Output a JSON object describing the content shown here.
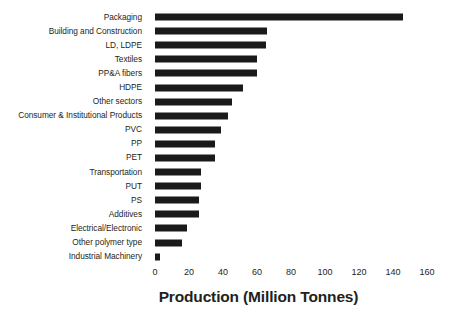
{
  "chart_data": {
    "type": "bar",
    "orientation": "horizontal",
    "title": "",
    "xlabel": "Production (Million Tonnes)",
    "ylabel": "",
    "xlim": [
      0,
      160
    ],
    "xticks": [
      0,
      20,
      40,
      60,
      80,
      100,
      120,
      140,
      160
    ],
    "grid": false,
    "legend": false,
    "bar_color": "#1a1a1a",
    "background_color": "#ffffff",
    "categories": [
      "Packaging",
      "Building and Construction",
      "LD, LDPE",
      "Textiles",
      "PP&A fibers",
      "HDPE",
      "Other sectors",
      "Consumer & Institutional Products",
      "PVC",
      "PP",
      "PET",
      "Transportation",
      "PUT",
      "PS",
      "Additives",
      "Electrical/Electronic",
      "Other polymer type",
      "Industrial Machinery"
    ],
    "values": [
      146,
      66,
      65,
      60,
      60,
      52,
      45,
      43,
      39,
      35,
      35,
      27,
      27,
      26,
      26,
      19,
      16,
      3
    ]
  },
  "axis": {
    "x_title": "Production (Million Tonnes)",
    "ticks": [
      {
        "label": "0",
        "value": 0
      },
      {
        "label": "20",
        "value": 20
      },
      {
        "label": "40",
        "value": 40
      },
      {
        "label": "60",
        "value": 60
      },
      {
        "label": "80",
        "value": 80
      },
      {
        "label": "100",
        "value": 100
      },
      {
        "label": "120",
        "value": 120
      },
      {
        "label": "140",
        "value": 140
      },
      {
        "label": "160",
        "value": 160
      }
    ]
  }
}
